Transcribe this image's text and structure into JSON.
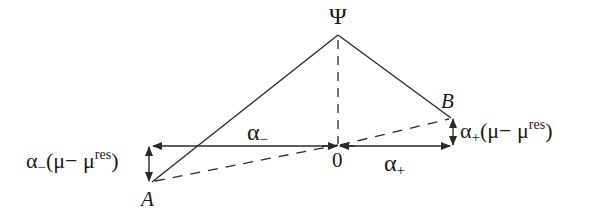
{
  "diagram": {
    "type": "geometric construction",
    "apex": {
      "label": "Ψ",
      "x": 338,
      "y": 35
    },
    "points": {
      "A": {
        "label": "A",
        "x": 152,
        "y": 182
      },
      "B": {
        "label": "B",
        "x": 451,
        "y": 118
      },
      "origin": {
        "label": "0",
        "x": 338,
        "y": 145
      }
    },
    "segments": {
      "left_horizontal": {
        "label_base": "α",
        "label_sub": "−"
      },
      "right_horizontal": {
        "label_base": "α",
        "label_sub": "+"
      }
    },
    "offsets": {
      "left": {
        "base": "α",
        "sub": "−",
        "open": "(μ− μ",
        "sup": "res",
        "close": ")"
      },
      "right": {
        "base": "α",
        "sub": "+",
        "open": "(μ− μ",
        "sup": "res",
        "close": ")"
      }
    },
    "colors": {
      "stroke": "#2a2a2a",
      "background": "#ffffff"
    }
  }
}
